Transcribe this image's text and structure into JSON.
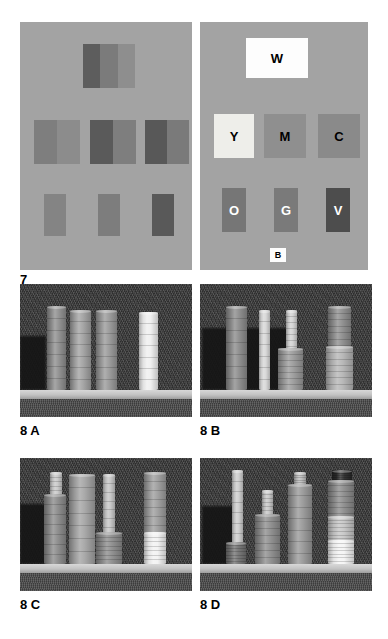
{
  "page": {
    "background": "#ffffff",
    "width": 388,
    "height": 639
  },
  "figure7": {
    "label": "7",
    "panel_background": "#a3a3a3",
    "left_panel": {
      "name": "achromatic-patch-panel",
      "patches": [
        {
          "id": "top-center",
          "x": 63,
          "y": 22,
          "w": 52,
          "h": 44,
          "halves": [
            "#5d5d5d",
            "#7b7b7b",
            "#8e8e8e"
          ]
        },
        {
          "id": "mid-left",
          "x": 14,
          "y": 98,
          "w": 46,
          "h": 44,
          "halves": [
            "#7e7e7e",
            "#8c8c8c"
          ]
        },
        {
          "id": "mid-center",
          "x": 70,
          "y": 98,
          "w": 46,
          "h": 44,
          "halves": [
            "#5a5a5a",
            "#7e7e7e"
          ]
        },
        {
          "id": "mid-right",
          "x": 125,
          "y": 98,
          "w": 44,
          "h": 44,
          "halves": [
            "#585858",
            "#7a7a7a"
          ]
        },
        {
          "id": "low-left",
          "x": 24,
          "y": 172,
          "w": 22,
          "h": 42,
          "halves": [
            "#848484"
          ]
        },
        {
          "id": "low-center",
          "x": 78,
          "y": 172,
          "w": 22,
          "h": 42,
          "halves": [
            "#7d7d7d"
          ]
        },
        {
          "id": "low-right",
          "x": 132,
          "y": 172,
          "w": 22,
          "h": 42,
          "halves": [
            "#595959"
          ]
        }
      ]
    },
    "right_panel": {
      "name": "labelled-colour-patch-panel",
      "patches": [
        {
          "label": "W",
          "x": 46,
          "y": 16,
          "w": 62,
          "h": 40,
          "fill": "#fdfdfd",
          "text_color": "#000000"
        },
        {
          "label": "Y",
          "x": 14,
          "y": 92,
          "w": 40,
          "h": 44,
          "fill": "#eeeeea",
          "text_color": "#000000"
        },
        {
          "label": "M",
          "x": 64,
          "y": 92,
          "w": 42,
          "h": 44,
          "fill": "#8f8f8f",
          "text_color": "#000000"
        },
        {
          "label": "C",
          "x": 118,
          "y": 92,
          "w": 42,
          "h": 44,
          "fill": "#8a8a8a",
          "text_color": "#000000"
        },
        {
          "label": "O",
          "x": 22,
          "y": 166,
          "w": 24,
          "h": 44,
          "fill": "#767676",
          "text_color": "#ffffff"
        },
        {
          "label": "G",
          "x": 74,
          "y": 166,
          "w": 24,
          "h": 44,
          "fill": "#7a7a7a",
          "text_color": "#ffffff"
        },
        {
          "label": "V",
          "x": 126,
          "y": 166,
          "w": 24,
          "h": 44,
          "fill": "#4d4d4d",
          "text_color": "#ffffff"
        },
        {
          "label": "B",
          "x": 70,
          "y": 226,
          "w": 16,
          "h": 14,
          "fill": "#fdfdfd",
          "text_color": "#000000"
        }
      ]
    }
  },
  "figure8": {
    "panels": [
      {
        "label": "8 A",
        "name": "cylinder-scene-a",
        "x": 20,
        "y": 284,
        "w": 172,
        "h": 133,
        "shelf_top": 106,
        "shelf_height": 9,
        "shadow": {
          "x": 0,
          "y": 52,
          "w": 26,
          "h": 54
        },
        "cylinders": [
          {
            "id": "a1",
            "x": 27,
            "y": 22,
            "w": 19,
            "h": 84,
            "fill": "#8e8e8e"
          },
          {
            "id": "a2",
            "x": 50,
            "y": 26,
            "w": 21,
            "h": 80,
            "fill": "#a2a2a2"
          },
          {
            "id": "a3",
            "x": 76,
            "y": 26,
            "w": 21,
            "h": 80,
            "fill": "#999999"
          },
          {
            "id": "a4",
            "x": 119,
            "y": 28,
            "w": 19,
            "h": 78,
            "fill": "#efefef"
          }
        ]
      },
      {
        "label": "8 B",
        "name": "cylinder-scene-b",
        "x": 200,
        "y": 284,
        "w": 172,
        "h": 133,
        "shelf_top": 106,
        "shelf_height": 9,
        "shadow": {
          "x": 2,
          "y": 44,
          "w": 86,
          "h": 62
        },
        "cylinders": [
          {
            "id": "b1",
            "x": 26,
            "y": 22,
            "w": 21,
            "h": 84,
            "fill": "#8b8b8b"
          },
          {
            "id": "b2",
            "x": 59,
            "y": 26,
            "w": 11,
            "h": 80,
            "fill": "#d7d7d7"
          },
          {
            "id": "b3",
            "x": 86,
            "y": 26,
            "w": 11,
            "h": 42,
            "fill": "#d2d2d2"
          },
          {
            "id": "b4",
            "x": 78,
            "y": 64,
            "w": 25,
            "h": 42,
            "fill": "#9a9a9a"
          },
          {
            "id": "b5",
            "x": 128,
            "y": 22,
            "w": 23,
            "h": 46,
            "fill": "#8d8d8d"
          },
          {
            "id": "b6",
            "x": 126,
            "y": 62,
            "w": 27,
            "h": 44,
            "fill": "#b5b5b5"
          }
        ]
      },
      {
        "label": "8 C",
        "name": "cylinder-scene-c",
        "x": 20,
        "y": 458,
        "w": 172,
        "h": 133,
        "shelf_top": 106,
        "shelf_height": 9,
        "shadow": {
          "x": 0,
          "y": 46,
          "w": 30,
          "h": 60
        },
        "cylinders": [
          {
            "id": "c1",
            "x": 30,
            "y": 14,
            "w": 12,
            "h": 32,
            "fill": "#c9c9c9"
          },
          {
            "id": "c2",
            "x": 24,
            "y": 36,
            "w": 22,
            "h": 70,
            "fill": "#8a8a8a"
          },
          {
            "id": "c3",
            "x": 49,
            "y": 16,
            "w": 26,
            "h": 90,
            "fill": "#a3a3a3"
          },
          {
            "id": "c4",
            "x": 83,
            "y": 16,
            "w": 12,
            "h": 62,
            "fill": "#c5c5c5"
          },
          {
            "id": "c5",
            "x": 76,
            "y": 74,
            "w": 26,
            "h": 32,
            "fill": "#8c8c8c"
          },
          {
            "id": "c6",
            "x": 124,
            "y": 14,
            "w": 22,
            "h": 62,
            "fill": "#9d9d9d"
          },
          {
            "id": "c7",
            "x": 124,
            "y": 74,
            "w": 22,
            "h": 32,
            "fill": "#f2f2f2"
          }
        ]
      },
      {
        "label": "8 D",
        "name": "cylinder-scene-d",
        "x": 200,
        "y": 458,
        "w": 172,
        "h": 133,
        "shelf_top": 106,
        "shelf_height": 9,
        "shadow": {
          "x": 2,
          "y": 48,
          "w": 32,
          "h": 58
        },
        "cylinders": [
          {
            "id": "d1",
            "x": 32,
            "y": 12,
            "w": 11,
            "h": 74,
            "fill": "#cccccc"
          },
          {
            "id": "d2",
            "x": 26,
            "y": 84,
            "w": 20,
            "h": 22,
            "fill": "#737373"
          },
          {
            "id": "d3",
            "x": 62,
            "y": 32,
            "w": 11,
            "h": 28,
            "fill": "#c7c7c7"
          },
          {
            "id": "d4",
            "x": 55,
            "y": 56,
            "w": 25,
            "h": 50,
            "fill": "#8d8d8d"
          },
          {
            "id": "d5",
            "x": 94,
            "y": 14,
            "w": 12,
            "h": 18,
            "fill": "#bdbdbd"
          },
          {
            "id": "d6",
            "x": 88,
            "y": 26,
            "w": 24,
            "h": 80,
            "fill": "#989898"
          },
          {
            "id": "d7",
            "x": 132,
            "y": 12,
            "w": 20,
            "h": 12,
            "fill": "#2b2b2b"
          },
          {
            "id": "d8",
            "x": 128,
            "y": 22,
            "w": 26,
            "h": 38,
            "fill": "#8b8b8b"
          },
          {
            "id": "d9",
            "x": 128,
            "y": 58,
            "w": 26,
            "h": 26,
            "fill": "#c6c6c6"
          },
          {
            "id": "d10",
            "x": 128,
            "y": 82,
            "w": 26,
            "h": 24,
            "fill": "#f4f4f4"
          }
        ]
      }
    ]
  }
}
